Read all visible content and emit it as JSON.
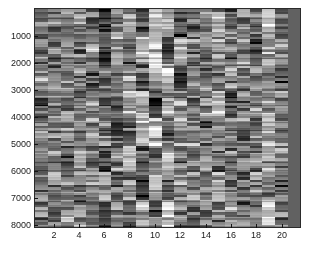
{
  "figure": {
    "title": "",
    "background_color": "#ffffff",
    "width": 316,
    "height": 253
  },
  "axes": {
    "x": {
      "label": "",
      "tick_labels": [
        "2",
        "4",
        "6",
        "8",
        "10",
        "12",
        "14",
        "16",
        "18",
        "20"
      ],
      "tick_values": [
        2,
        4,
        6,
        8,
        10,
        12,
        14,
        16,
        18,
        20
      ],
      "limits": [
        0.5,
        21.5
      ]
    },
    "y": {
      "label": "",
      "tick_labels": [
        "1000",
        "2000",
        "3000",
        "4000",
        "5000",
        "6000",
        "7000",
        "8000"
      ],
      "tick_values": [
        1000,
        2000,
        3000,
        4000,
        5000,
        6000,
        7000,
        8000
      ],
      "limits": [
        0,
        8200
      ]
    }
  },
  "chart_data": {
    "type": "heatmap",
    "title": "",
    "xlabel": "",
    "ylabel": "",
    "colormap": "gray",
    "xlim": [
      0.5,
      21.5
    ],
    "ylim": [
      0,
      8200
    ],
    "grid": false,
    "legend": "none",
    "n_columns": 21,
    "n_rows": 8200,
    "row_block_count": 88,
    "value_range": [
      0,
      1
    ],
    "column_block_means": [
      [
        0.5,
        0.46,
        0.42,
        0.52,
        0.44,
        0.3,
        0.55,
        0.62,
        0.28,
        0.75,
        0.7,
        0.33,
        0.48,
        0.52,
        0.65,
        0.4,
        0.5,
        0.46,
        0.72,
        0.44,
        0.38
      ],
      [
        0.44,
        0.52,
        0.48,
        0.4,
        0.56,
        0.18,
        0.6,
        0.34,
        0.7,
        0.82,
        0.3,
        0.66,
        0.42,
        0.5,
        0.58,
        0.46,
        0.52,
        0.38,
        0.62,
        0.48,
        0.38
      ],
      [
        0.52,
        0.4,
        0.54,
        0.46,
        0.38,
        0.45,
        0.5,
        0.58,
        0.36,
        0.68,
        0.74,
        0.22,
        0.55,
        0.44,
        0.42,
        0.52,
        0.48,
        0.55,
        0.5,
        0.4,
        0.38
      ],
      [
        0.38,
        0.56,
        0.44,
        0.5,
        0.48,
        0.36,
        0.42,
        0.66,
        0.74,
        0.25,
        0.6,
        0.52,
        0.38,
        0.56,
        0.7,
        0.34,
        0.46,
        0.5,
        0.56,
        0.52,
        0.38
      ],
      [
        0.48,
        0.44,
        0.5,
        0.42,
        0.52,
        0.55,
        0.36,
        0.3,
        0.62,
        0.78,
        0.4,
        0.58,
        0.5,
        0.38,
        0.48,
        0.56,
        0.42,
        0.44,
        0.66,
        0.46,
        0.38
      ],
      [
        0.55,
        0.48,
        0.38,
        0.56,
        0.42,
        0.2,
        0.52,
        0.72,
        0.34,
        0.5,
        0.8,
        0.44,
        0.46,
        0.6,
        0.38,
        0.48,
        0.54,
        0.4,
        0.58,
        0.5,
        0.38
      ],
      [
        0.42,
        0.5,
        0.46,
        0.44,
        0.58,
        0.62,
        0.4,
        0.48,
        0.26,
        0.72,
        0.36,
        0.54,
        0.52,
        0.42,
        0.64,
        0.44,
        0.38,
        0.52,
        0.48,
        0.42,
        0.38
      ],
      [
        0.5,
        0.42,
        0.52,
        0.48,
        0.36,
        0.28,
        0.58,
        0.4,
        0.68,
        0.3,
        0.76,
        0.46,
        0.4,
        0.5,
        0.52,
        0.6,
        0.46,
        0.44,
        0.7,
        0.48,
        0.38
      ]
    ]
  }
}
